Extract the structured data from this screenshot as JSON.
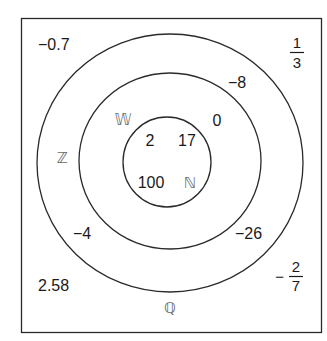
{
  "diagram": {
    "type": "nested-set-venn",
    "colors": {
      "stroke": "#2a2a2a",
      "text": "#1a1a1a",
      "set_label": "#6a6a6a",
      "background": "#ffffff"
    },
    "sets": {
      "natural": {
        "symbol": "ℕ",
        "members": [
          "2",
          "17",
          "100"
        ]
      },
      "whole": {
        "symbol": "𝕎",
        "members": [
          "0"
        ]
      },
      "integers": {
        "symbol": "ℤ",
        "members": [
          "−8",
          "−4",
          "−26"
        ]
      },
      "rationals": {
        "symbol": "ℚ",
        "members": [
          "−0.7",
          "2.58"
        ],
        "fractions": [
          {
            "sign": "",
            "numerator": "1",
            "denominator": "3"
          },
          {
            "sign": "−",
            "numerator": "2",
            "denominator": "7"
          }
        ]
      }
    }
  }
}
